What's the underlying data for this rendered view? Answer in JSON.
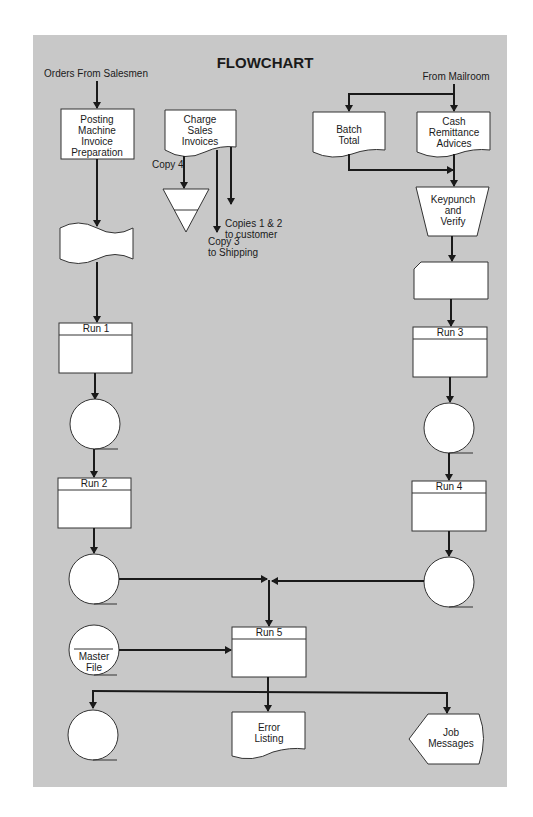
{
  "diagram": {
    "title": "FLOWCHART",
    "background_color": "#c8c8c8",
    "inputs": {
      "orders": "Orders From Salesmen",
      "mailroom": "From Mailroom"
    },
    "nodes": {
      "posting": [
        "Posting",
        "Machine",
        "Invoice",
        "Preparation"
      ],
      "charge": [
        "Charge",
        "Sales",
        "Invoices"
      ],
      "batch": [
        "Batch",
        "Total"
      ],
      "cash": [
        "Cash",
        "Remittance",
        "Advices"
      ],
      "keypunch": [
        "Keypunch",
        "and",
        "Verify"
      ],
      "run1": "Run 1",
      "run2": "Run 2",
      "run3": "Run 3",
      "run4": "Run 4",
      "run5": "Run 5",
      "master": [
        "Master",
        "File"
      ],
      "error": [
        "Error",
        "Listing"
      ],
      "job": [
        "Job",
        "Messages"
      ]
    },
    "annotations": {
      "copy4": "Copy 4",
      "copies12": [
        "Copies 1 & 2",
        "to customer"
      ],
      "copy3": [
        "Copy 3",
        "to Shipping"
      ]
    }
  }
}
